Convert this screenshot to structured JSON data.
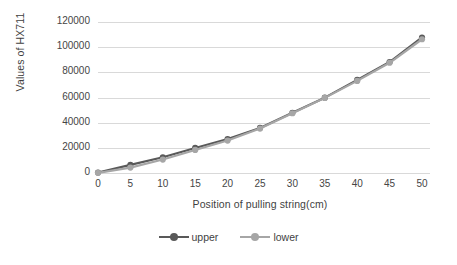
{
  "chart_data": {
    "type": "line",
    "title": "",
    "xlabel": "Position of pulling string(cm)",
    "ylabel": "Values of HX711",
    "xlim": [
      0,
      50
    ],
    "ylim": [
      0,
      120000
    ],
    "xticks": [
      "0",
      "5",
      "10",
      "15",
      "20",
      "25",
      "30",
      "35",
      "40",
      "45",
      "50"
    ],
    "yticks": [
      "0",
      "20000",
      "40000",
      "60000",
      "80000",
      "100000",
      "120000"
    ],
    "x": [
      0,
      5,
      10,
      15,
      20,
      25,
      30,
      35,
      40,
      45,
      50
    ],
    "grid": true,
    "legend_position": "bottom",
    "series": [
      {
        "name": "upper",
        "color": "#595959",
        "values": [
          300,
          6500,
          12500,
          19900,
          27000,
          35800,
          47800,
          59900,
          74000,
          88200,
          107700
        ]
      },
      {
        "name": "lower",
        "color": "#a6a6a6",
        "values": [
          100,
          4300,
          10700,
          18300,
          25800,
          35300,
          47500,
          59700,
          73200,
          87600,
          106300
        ]
      }
    ]
  },
  "legend": {
    "items": [
      {
        "label": "upper",
        "color": "#595959"
      },
      {
        "label": "lower",
        "color": "#a6a6a6"
      }
    ]
  },
  "axes": {
    "x_title": "Position of pulling string(cm)",
    "y_title": "Values of HX711"
  }
}
